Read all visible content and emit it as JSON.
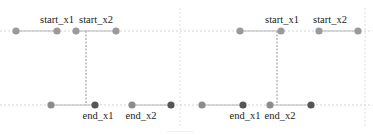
{
  "diagram": {
    "type": "interval-overlap-illustration",
    "colors": {
      "start_dot": "#9a9a9a",
      "end_dot_light": "#8c8c8c",
      "end_dot_dark": "#555555",
      "segment": "#b8b8b8",
      "guide_dashed": "#c8c8c8",
      "connector_dashed": "#888888",
      "text": "#222222"
    },
    "row_y": {
      "start": 31,
      "end": 105
    },
    "panels": [
      {
        "name": "left-panel",
        "start_row": {
          "dots": [
            16,
            57,
            76,
            116
          ],
          "segments": [
            [
              16,
              57
            ],
            [
              76,
              116
            ]
          ],
          "labels": [
            {
              "text": "start_x1",
              "x": 57
            },
            {
              "text": "start_x2",
              "x": 96
            }
          ]
        },
        "end_row": {
          "dots": [
            {
              "x": 51,
              "tone": "light"
            },
            {
              "x": 95,
              "tone": "dark"
            },
            {
              "x": 132,
              "tone": "light"
            },
            {
              "x": 171,
              "tone": "dark"
            }
          ],
          "segments": [
            [
              51,
              95
            ],
            [
              132,
              171
            ]
          ],
          "labels": [
            {
              "text": "end_x1",
              "x": 98
            },
            {
              "text": "end_x2",
              "x": 141
            }
          ]
        },
        "connector_x": 86
      },
      {
        "name": "right-panel",
        "start_row": {
          "dots": [
            240,
            281,
            319,
            358
          ],
          "segments": [
            [
              240,
              281
            ],
            [
              319,
              358
            ]
          ],
          "labels": [
            {
              "text": "start_x1",
              "x": 282
            },
            {
              "text": "start_x2",
              "x": 330
            }
          ]
        },
        "end_row": {
          "dots": [
            {
              "x": 202,
              "tone": "light"
            },
            {
              "x": 243,
              "tone": "dark"
            },
            {
              "x": 270,
              "tone": "light"
            },
            {
              "x": 311,
              "tone": "dark"
            }
          ],
          "segments": [
            [
              202,
              243
            ],
            [
              270,
              311
            ]
          ],
          "labels": [
            {
              "text": "end_x1",
              "x": 245
            },
            {
              "text": "end_x2",
              "x": 280
            }
          ]
        },
        "connector_x": 277
      }
    ],
    "gridlines_x": [
      180,
      365
    ],
    "caption": "............"
  }
}
